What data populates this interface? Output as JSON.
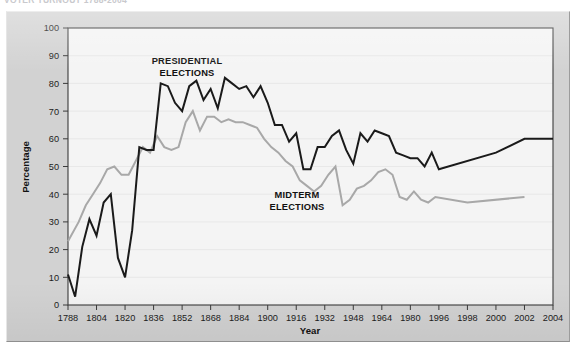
{
  "caption": {
    "clipped_text": "VOTER TURNOUT 1788-2004"
  },
  "chart_data": {
    "type": "line",
    "title": "",
    "xlabel": "Year",
    "ylabel": "Percentage",
    "ylim": [
      0,
      100
    ],
    "ytick_step": 10,
    "yticks": [
      0,
      10,
      20,
      30,
      40,
      50,
      60,
      70,
      80,
      90,
      100
    ],
    "xlim": [
      1788,
      2004
    ],
    "xticks": [
      1788,
      1804,
      1820,
      1836,
      1852,
      1868,
      1884,
      1900,
      1916,
      1932,
      1948,
      1964,
      1980,
      1996,
      1998,
      2000,
      2002,
      2004
    ],
    "xtick_labels": [
      "1788",
      "1804",
      "1820",
      "1836",
      "1852",
      "1868",
      "1884",
      "1900",
      "1916",
      "1932",
      "1948",
      "1964",
      "1980",
      "1996",
      "1998",
      "2000",
      "2002",
      "2004"
    ],
    "grid": true,
    "legend_position": "inline-annotation",
    "annotations": [
      {
        "name": "presidential-label",
        "text": "PRESIDENTIAL\nELECTIONS",
        "lines": [
          "PRESIDENTIAL",
          "ELECTIONS"
        ],
        "x_px": 180,
        "y_px": 52
      },
      {
        "name": "midterm-label",
        "text": "MIDTERM\nELECTIONS",
        "lines": [
          "MIDTERM",
          "ELECTIONS"
        ],
        "x_px": 290,
        "y_px": 186
      }
    ],
    "series": [
      {
        "name": "PRESIDENTIAL ELECTIONS",
        "color": "#1a1a1a",
        "stroke_width": 2.0,
        "x": [
          1788,
          1792,
          1796,
          1800,
          1804,
          1808,
          1812,
          1816,
          1820,
          1824,
          1828,
          1832,
          1836,
          1840,
          1844,
          1848,
          1852,
          1856,
          1860,
          1864,
          1868,
          1872,
          1876,
          1880,
          1884,
          1888,
          1892,
          1896,
          1900,
          1904,
          1908,
          1912,
          1916,
          1920,
          1924,
          1928,
          1932,
          1936,
          1940,
          1944,
          1948,
          1952,
          1956,
          1960,
          1964,
          1968,
          1972,
          1976,
          1980,
          1984,
          1988,
          1992,
          1996,
          2000,
          2002,
          2004
        ],
        "y": [
          11,
          3,
          21,
          31,
          25,
          37,
          40,
          17,
          10,
          27,
          57,
          56,
          56,
          80,
          79,
          73,
          70,
          79,
          81,
          74,
          78,
          71,
          82,
          80,
          78,
          79,
          75,
          79,
          73,
          65,
          65,
          59,
          62,
          49,
          49,
          57,
          57,
          61,
          63,
          56,
          51,
          62,
          59,
          63,
          62,
          61,
          55,
          54,
          53,
          53,
          50,
          55,
          49,
          55,
          60,
          60
        ]
      },
      {
        "name": "MIDTERM ELECTIONS",
        "color": "#a8a8a8",
        "stroke_width": 2.0,
        "x": [
          1788,
          1794,
          1798,
          1802,
          1806,
          1810,
          1814,
          1818,
          1822,
          1826,
          1830,
          1834,
          1838,
          1842,
          1846,
          1850,
          1854,
          1858,
          1862,
          1866,
          1870,
          1874,
          1878,
          1882,
          1886,
          1890,
          1894,
          1898,
          1902,
          1906,
          1910,
          1914,
          1918,
          1922,
          1926,
          1930,
          1934,
          1938,
          1942,
          1946,
          1950,
          1954,
          1958,
          1962,
          1966,
          1970,
          1974,
          1978,
          1982,
          1986,
          1990,
          1994,
          1998,
          2002
        ],
        "y": [
          23,
          30,
          36,
          40,
          44,
          49,
          50,
          47,
          47,
          52,
          57,
          55,
          61,
          57,
          56,
          57,
          66,
          70,
          63,
          68,
          68,
          66,
          67,
          66,
          66,
          65,
          64,
          60,
          57,
          55,
          52,
          50,
          45,
          43,
          41,
          43,
          47,
          50,
          36,
          38,
          42,
          43,
          45,
          48,
          49,
          47,
          39,
          38,
          41,
          38,
          37,
          39,
          37,
          39
        ]
      }
    ]
  }
}
